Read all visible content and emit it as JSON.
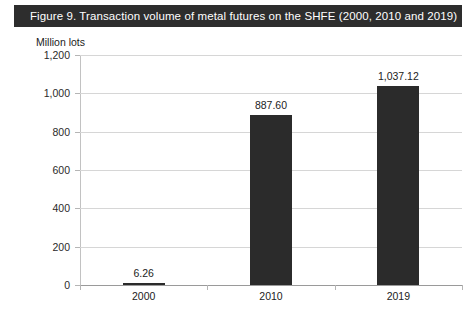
{
  "figure": {
    "title": "Figure 9.  Transaction volume of metal futures on the SHFE (2000, 2010 and 2019)",
    "title_bar_color": "#2d2d2d",
    "title_text_color": "#ffffff"
  },
  "chart_data": {
    "type": "bar",
    "title": "Figure 9.  Transaction volume of metal futures on the SHFE (2000, 2010 and 2019)",
    "categories": [
      "2000",
      "2010",
      "2019"
    ],
    "values": [
      6.26,
      887.6,
      1037.12
    ],
    "value_labels": [
      "6.26",
      "887.60",
      "1,037.12"
    ],
    "xlabel": "",
    "ylabel": "Million lots",
    "ylim": [
      0,
      1200
    ],
    "yticks": [
      0,
      200,
      400,
      600,
      800,
      1000,
      1200
    ],
    "ytick_labels": [
      "0",
      "200",
      "400",
      "600",
      "800",
      "1,000",
      "1,200"
    ],
    "grid": true,
    "legend": false,
    "bar_color": "#2b2b2b",
    "gridline_color": "#d6d6d6"
  }
}
